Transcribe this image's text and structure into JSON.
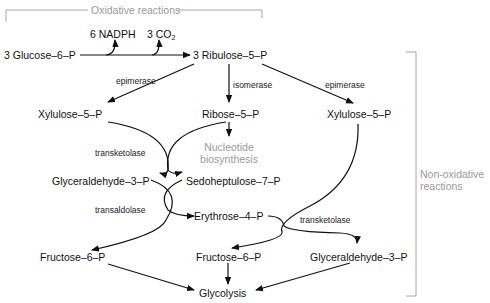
{
  "diagram": {
    "sections": {
      "oxidative": "Oxidative reactions",
      "non_oxidative_line1": "Non-oxidative",
      "non_oxidative_line2": "reactions"
    },
    "products_oxidative": {
      "nadph": "6 NADPH",
      "co2_prefix": "3 CO",
      "co2_sub": "2"
    },
    "metabolites": {
      "glucose6p": "3 Glucose–6–P",
      "ribulose5p": "3 Ribulose–5–P",
      "xylulose5p_left": "Xylulose–5–P",
      "ribose5p": "Ribose–5–P",
      "xylulose5p_right": "Xylulose–5–P",
      "nucleotide_line1": "Nucleotide",
      "nucleotide_line2": "biosynthesis",
      "glyceraldehyde3p_left": "Glyceraldehyde–3–P",
      "sedoheptulose7p": "Sedoheptulose–7–P",
      "erythrose4p": "Erythrose–4–P",
      "fructose6p_left": "Fructose–6–P",
      "fructose6p_mid": "Fructose–6–P",
      "glyceraldehyde3p_right": "Glyceraldehyde–3–P",
      "glycolysis": "Glycolysis"
    },
    "enzymes": {
      "epimerase_left": "epimerase",
      "isomerase": "isomerase",
      "epimerase_right": "epimerase",
      "transketolase_1": "transketolase",
      "transaldolase": "transaldolase",
      "transketolase_2": "transketolase"
    },
    "colors": {
      "text": "#111111",
      "arrow": "#111111",
      "bracket": "#a0a0a0",
      "muted_text": "#9a9a9a"
    }
  }
}
